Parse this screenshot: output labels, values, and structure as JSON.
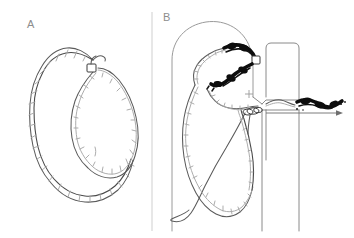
{
  "figure": {
    "width": 354,
    "height": 238,
    "background": "#ffffff",
    "type": "scientific-diagram"
  },
  "panels": [
    {
      "id": "A",
      "label": "A",
      "label_x": 27,
      "label_y": 28,
      "description": "Free double-stranded DNA loop with a small square protein marker at the crossover junction",
      "elements": {
        "large_loop": "supercoiled-dna-loop",
        "small_loop": "secondary-dna-loop",
        "marker": "protein-square-marker"
      }
    },
    {
      "id": "B",
      "label": "B",
      "label_x": 163,
      "label_y": 21,
      "description": "DNA translocating through a membrane nanopore with condensed protein-bound segments inside the capsid",
      "elements": {
        "capsid": "membrane-capsid-outline",
        "condensed_dna": "protein-condensed-dna-segment",
        "pore": "nanopore-channel",
        "wall": "membrane-wall",
        "translocating_dna": "translocating-dna-strand",
        "exit_dna": "exited-condensed-dna",
        "direction_arrow": "translocation-direction-arrow",
        "charge_symbol": "+",
        "marker": "protein-square-marker"
      }
    }
  ],
  "colors": {
    "dna_stroke": "#5a5a5a",
    "dna_stroke_light": "#a8a8a8",
    "condensed_dna": "#0d0d0d",
    "membrane": "#9a9a9a",
    "wall": "#8a8a8a",
    "divider": "#c9c9c9",
    "label_text": "#8d8d8d",
    "arrow": "#6e6e6e",
    "background": "#ffffff"
  },
  "divider": {
    "x": 152,
    "y_top": 10,
    "y_bottom": 231
  }
}
